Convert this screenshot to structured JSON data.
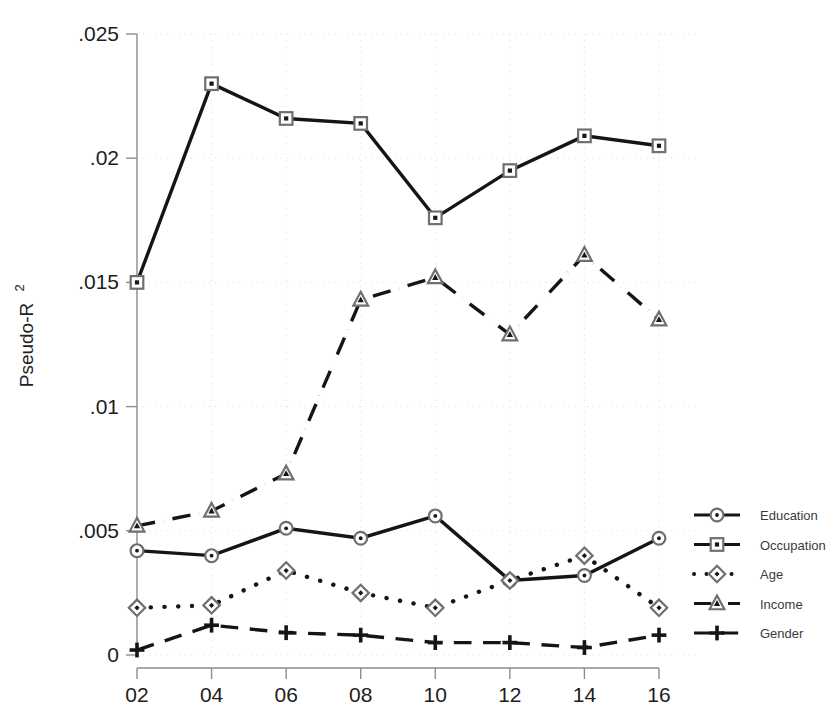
{
  "chart_data": {
    "type": "line",
    "title": "",
    "xlabel": "",
    "ylabel": "Pseudo-R",
    "ylabel_superscript": "2",
    "x": [
      "02",
      "04",
      "06",
      "08",
      "10",
      "12",
      "14",
      "16"
    ],
    "categories": [
      "02",
      "04",
      "06",
      "08",
      "10",
      "12",
      "14",
      "16"
    ],
    "xtick_labels": [
      "02",
      "04",
      "06",
      "08",
      "10",
      "12",
      "14",
      "16"
    ],
    "ytick_labels": [
      "0",
      ".005",
      ".01",
      ".015",
      ".02",
      ".025"
    ],
    "ytick_values": [
      0,
      0.005,
      0.01,
      0.015,
      0.02,
      0.025
    ],
    "ylim": [
      0,
      0.025
    ],
    "grid": "dotted-light",
    "legend_position": "right",
    "series": [
      {
        "name": "Education",
        "marker": "circle",
        "line_style": "solid",
        "values": [
          0.0042,
          0.004,
          0.0051,
          0.0047,
          0.0056,
          0.003,
          0.0032,
          0.0047
        ]
      },
      {
        "name": "Occupation",
        "marker": "square",
        "line_style": "solid",
        "values": [
          0.015,
          0.023,
          0.0216,
          0.0214,
          0.0176,
          0.0195,
          0.0209,
          0.0205
        ]
      },
      {
        "name": "Age",
        "marker": "diamond",
        "line_style": "dotted",
        "values": [
          0.0019,
          0.002,
          0.0034,
          0.0025,
          0.0019,
          0.003,
          0.004,
          0.0019
        ]
      },
      {
        "name": "Income",
        "marker": "triangle",
        "line_style": "dash-dot",
        "values": [
          0.0052,
          0.0058,
          0.0073,
          0.0143,
          0.0152,
          0.0129,
          0.0161,
          0.0135
        ]
      },
      {
        "name": "Gender",
        "marker": "plus",
        "line_style": "dashed",
        "values": [
          0.0002,
          0.0012,
          0.0009,
          0.0008,
          0.0005,
          0.0005,
          0.0003,
          0.0008
        ]
      }
    ]
  },
  "legend": {
    "items": [
      {
        "label": "Education"
      },
      {
        "label": "Occupation"
      },
      {
        "label": "Age"
      },
      {
        "label": "Income"
      },
      {
        "label": "Gender"
      }
    ]
  },
  "colors": {
    "line": "#151515",
    "marker_edge": "#6f6f6f",
    "axis": "#8d8d8d",
    "grid": "#d9d9d9",
    "text": "#1d1d1d",
    "background": "#ffffff"
  }
}
